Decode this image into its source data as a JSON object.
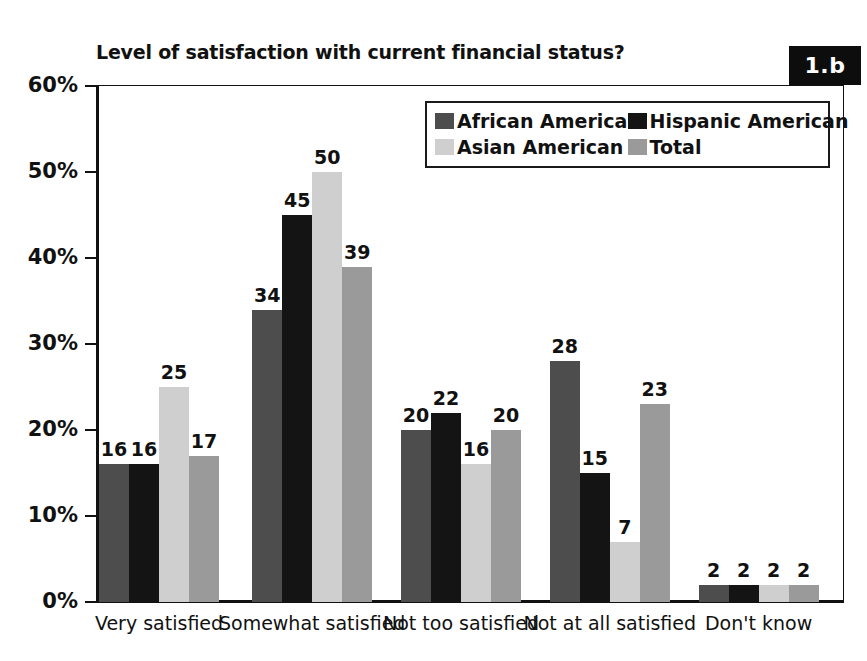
{
  "chart_data": {
    "type": "bar",
    "title": "Level of satisfaction with current financial status?",
    "xlabel": "",
    "ylabel": "",
    "ylim": [
      0,
      60
    ],
    "ytick_labels": [
      "0%",
      "10%",
      "20%",
      "30%",
      "40%",
      "50%",
      "60%"
    ],
    "ytick_values": [
      0,
      10,
      20,
      30,
      40,
      50,
      60
    ],
    "grid": false,
    "legend_position": "top-right-inside",
    "categories": [
      "Very satisfied",
      "Somewhat satisfied",
      "Not too satisfied",
      "Not at all satisfied",
      "Don't know"
    ],
    "series": [
      {
        "name": "African American",
        "color": "#4d4d4d",
        "values": [
          16,
          34,
          20,
          28,
          2
        ]
      },
      {
        "name": "Hispanic American",
        "color": "#141414",
        "values": [
          16,
          45,
          22,
          15,
          2
        ]
      },
      {
        "name": "Asian American",
        "color": "#cfcfcf",
        "values": [
          25,
          50,
          16,
          7,
          2
        ]
      },
      {
        "name": "Total",
        "color": "#9a9a9a",
        "values": [
          17,
          39,
          20,
          23,
          2
        ]
      }
    ],
    "value_label_suffix": ""
  },
  "badge": {
    "label": "1.b"
  },
  "legend": {
    "items": [
      {
        "label": "African American"
      },
      {
        "label": "Hispanic American"
      },
      {
        "label": "Asian American"
      },
      {
        "label": "Total"
      }
    ]
  },
  "colors": {
    "african_american": "#4d4d4d",
    "hispanic_american": "#141414",
    "asian_american": "#cfcfcf",
    "total": "#9a9a9a",
    "axis": "#111111",
    "badge_background": "#0d0d0d",
    "badge_text": "#ffffff",
    "background": "#ffffff"
  }
}
